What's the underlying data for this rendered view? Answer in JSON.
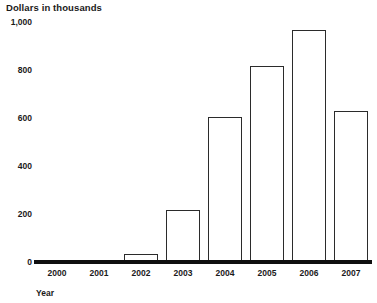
{
  "chart_data": {
    "type": "bar",
    "title": "Dollars in thousands",
    "xlabel": "Year",
    "ylabel": "Dollars in thousands",
    "categories": [
      "2000",
      "2001",
      "2002",
      "2003",
      "2004",
      "2005",
      "2006",
      "2007"
    ],
    "values": [
      0,
      0,
      35,
      215,
      605,
      815,
      965,
      630
    ],
    "ylim": [
      0,
      1000
    ],
    "yticks": [
      0,
      200,
      400,
      600,
      800,
      1000
    ],
    "ytick_labels": [
      "0",
      "200",
      "400",
      "600",
      "800",
      "1,000"
    ],
    "grid": false,
    "legend": null,
    "bar_fill_color": "#ffffff",
    "bar_border_color": "#2b2b2b",
    "axis_color": "#101010",
    "text_color": "#1a1a1a"
  }
}
